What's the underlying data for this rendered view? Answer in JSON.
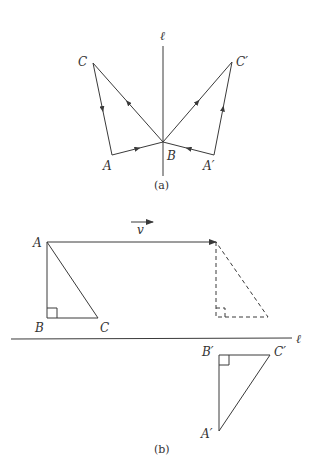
{
  "panel_a": {
    "caption": "(a)",
    "axis_label": "ℓ",
    "labels": {
      "A": "A",
      "B": "B",
      "C": "C",
      "A_prime": "A′",
      "C_prime": "C′"
    },
    "points": {
      "A": [
        112,
        155
      ],
      "B": [
        163,
        142
      ],
      "C": [
        93,
        63
      ],
      "A_prime": [
        214,
        155
      ],
      "C_prime": [
        232,
        62
      ]
    },
    "axis": {
      "x": 163,
      "y1": 46,
      "y2": 176
    }
  },
  "panel_b": {
    "caption": "(b)",
    "axis_label": "ℓ",
    "vector_label": "v",
    "labels": {
      "A": "A",
      "B": "B",
      "C": "C",
      "A_prime": "A′",
      "B_prime": "B′",
      "C_prime": "C′"
    },
    "original_triangle": {
      "A": [
        47,
        242
      ],
      "B": [
        47,
        318
      ],
      "C": [
        98,
        318
      ]
    },
    "translated_triangle_dashed": {
      "A": [
        216,
        242
      ],
      "B": [
        216,
        317
      ],
      "C": [
        268,
        317
      ]
    },
    "reflected_triangle": {
      "A_prime": [
        219,
        431
      ],
      "B_prime": [
        219,
        355
      ],
      "C_prime": [
        270,
        355
      ]
    },
    "axis": {
      "x1": 11,
      "x2": 292,
      "y": 339
    }
  }
}
